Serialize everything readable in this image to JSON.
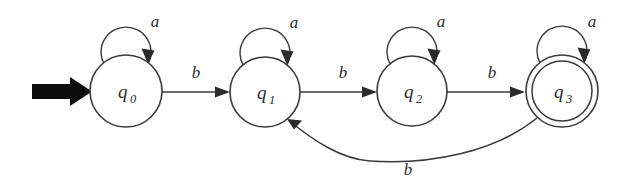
{
  "diagram": {
    "type": "finite-state-automaton",
    "alphabet": [
      "a",
      "b"
    ],
    "background_color": "#ffffff",
    "stroke_color": "#3a3a3a",
    "label_color": "#2b2b2b",
    "start_arrow": {
      "name": "start-arrow",
      "target_state": "q0",
      "color": "#0d0d0d"
    },
    "states": [
      {
        "id": "q0",
        "label_base": "q",
        "label_sub": "0",
        "cx": 126,
        "cy": 91,
        "r": 36,
        "accepting": false,
        "initial": true
      },
      {
        "id": "q1",
        "label_base": "q",
        "label_sub": "1",
        "cx": 265,
        "cy": 92,
        "r": 35,
        "accepting": false,
        "initial": false
      },
      {
        "id": "q2",
        "label_base": "q",
        "label_sub": "2",
        "cx": 412,
        "cy": 91,
        "r": 35,
        "accepting": false,
        "initial": false
      },
      {
        "id": "q3",
        "label_base": "q",
        "label_sub": "3",
        "cx": 562,
        "cy": 91,
        "r": 36,
        "r_inner": 30,
        "accepting": true,
        "initial": false
      }
    ],
    "self_loops": [
      {
        "state": "q0",
        "symbol": "a",
        "label_x": 155,
        "label_y": 27
      },
      {
        "state": "q1",
        "symbol": "a",
        "label_x": 294,
        "label_y": 28
      },
      {
        "state": "q2",
        "symbol": "a",
        "label_x": 441,
        "label_y": 27
      },
      {
        "state": "q3",
        "symbol": "a",
        "label_x": 592,
        "label_y": 27
      }
    ],
    "transitions": [
      {
        "from": "q0",
        "to": "q1",
        "symbol": "b",
        "label_x": 196,
        "label_y": 78,
        "shape": "straight"
      },
      {
        "from": "q1",
        "to": "q2",
        "symbol": "b",
        "label_x": 343,
        "label_y": 78,
        "shape": "straight"
      },
      {
        "from": "q2",
        "to": "q3",
        "symbol": "b",
        "label_x": 492,
        "label_y": 78,
        "shape": "straight"
      },
      {
        "from": "q3",
        "to": "q1",
        "symbol": "b",
        "label_x": 408,
        "label_y": 173,
        "shape": "curve-below"
      }
    ]
  }
}
